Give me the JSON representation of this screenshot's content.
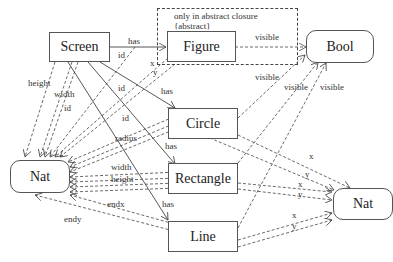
{
  "diagram": {
    "closure": {
      "line1": "only in abstract closure",
      "line2": "{abstract}"
    },
    "nodes": {
      "screen": "Screen",
      "figure": "Figure",
      "circle": "Circle",
      "rectangle": "Rectangle",
      "line": "Line",
      "bool": "Bool",
      "nat_left": "Nat",
      "nat_right": "Nat"
    },
    "edges": {
      "screen_figure_has": "has",
      "screen_circle_has": "has",
      "screen_rectangle_has": "has",
      "screen_line_has": "has",
      "figure_id": "id",
      "circle_id": "id",
      "rectangle_id": "id",
      "line_id": "id",
      "screen_height": "height",
      "screen_width": "width",
      "screen_id": "id",
      "figure_x": "x",
      "figure_y": "y",
      "figure_visible": "visible",
      "circle_visible": "visible",
      "rectangle_visible": "visible",
      "line_visible": "visible",
      "circle_radius": "radius",
      "rectangle_width": "width",
      "rectangle_height": "height",
      "line_endx": "endx",
      "line_endy": "endy",
      "circle_x": "x",
      "circle_y": "y",
      "rectangle_x": "x",
      "rectangle_y": "y",
      "line_x": "x",
      "line_y": "y"
    }
  }
}
